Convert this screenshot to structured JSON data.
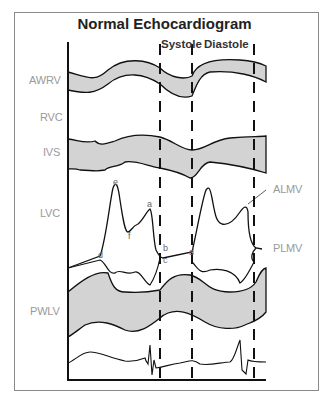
{
  "title": "Normal Echocardiogram",
  "phases": {
    "systole": "Systole",
    "diastole": "Diastole"
  },
  "structures": {
    "awrv": "AWRV",
    "rvc": "RVC",
    "ivs": "IVS",
    "lvc": "LVC",
    "pwlv": "PWLV"
  },
  "valve_labels": {
    "almv": "ALMV",
    "plmv": "PLMV"
  },
  "mitral_points": {
    "e": "e",
    "a": "a",
    "f": "f",
    "d1": "d",
    "b": "b",
    "c": "c",
    "d2": "d"
  },
  "colors": {
    "band_fill": "#d3d3d3",
    "line": "#111111",
    "label_gray": "#9a9a9a",
    "frame": "#8a8a8a"
  }
}
